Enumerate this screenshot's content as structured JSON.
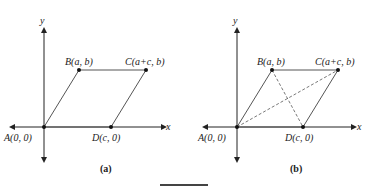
{
  "figures": [
    {
      "id": "a",
      "caption": "(a)",
      "axis_x_label": "x",
      "axis_y_label": "y",
      "points": {
        "A": "A(0, 0)",
        "B": "B(a, b)",
        "C": "C(a+c, b)",
        "D": "D(c, 0)"
      },
      "diagonals": false
    },
    {
      "id": "b",
      "caption": "(b)",
      "axis_x_label": "x",
      "axis_y_label": "y",
      "points": {
        "A": "A(0, 0)",
        "B": "B(a, b)",
        "C": "C(a+c, b)",
        "D": "D(c, 0)"
      },
      "diagonals": true
    }
  ],
  "colors": {
    "axes": "#222222",
    "parallelogram": "#555555",
    "diagonals": "#555555"
  }
}
